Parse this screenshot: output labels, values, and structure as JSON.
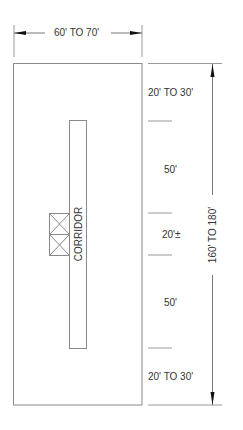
{
  "diagram": {
    "width_dimension": "60' TO 70'",
    "length_dimension": "160' TO 180'",
    "corridor_label": "CORRIDOR",
    "segments": [
      {
        "label": "20' TO 30'"
      },
      {
        "label": "50'"
      },
      {
        "label": "20'±"
      },
      {
        "label": "50'"
      },
      {
        "label": "20' TO 30'"
      }
    ],
    "colors": {
      "line": "#8a8a8a",
      "text": "#333333",
      "arrow": "#111111"
    }
  }
}
